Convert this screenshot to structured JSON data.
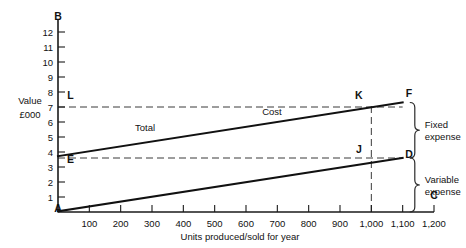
{
  "chart_data": {
    "type": "line",
    "title": "",
    "xlabel": "Units produced/sold for year",
    "ylabel": "Value £000",
    "xlim": [
      0,
      1200
    ],
    "ylim": [
      0,
      12.8
    ],
    "grid": false,
    "legend": "none",
    "x_ticks": [
      {
        "value": 0,
        "label": "A"
      },
      {
        "value": 100,
        "label": "100"
      },
      {
        "value": 200,
        "label": "200"
      },
      {
        "value": 300,
        "label": "300"
      },
      {
        "value": 400,
        "label": "400"
      },
      {
        "value": 500,
        "label": "500"
      },
      {
        "value": 600,
        "label": "600"
      },
      {
        "value": 700,
        "label": "700"
      },
      {
        "value": 800,
        "label": "800"
      },
      {
        "value": 900,
        "label": "900"
      },
      {
        "value": 1000,
        "label": "1,000"
      },
      {
        "value": 1100,
        "label": "1,100"
      },
      {
        "value": 1200,
        "label": "1,200"
      }
    ],
    "y_ticks": [
      {
        "value": 1,
        "label": "1"
      },
      {
        "value": 2,
        "label": "2"
      },
      {
        "value": 3,
        "label": "3"
      },
      {
        "value": 4,
        "label": "4"
      },
      {
        "value": 5,
        "label": "5"
      },
      {
        "value": 6,
        "label": "6"
      },
      {
        "value": 7,
        "label": "7"
      },
      {
        "value": 8,
        "label": "8"
      },
      {
        "value": 9,
        "label": "9"
      },
      {
        "value": 10,
        "label": "10"
      },
      {
        "value": 11,
        "label": "11"
      },
      {
        "value": 12,
        "label": "12"
      }
    ],
    "series": [
      {
        "name": "Total Cost",
        "label_left": "Total",
        "label_right": "Cost",
        "points": [
          [
            0,
            3.72
          ],
          [
            1100,
            7.3
          ]
        ]
      },
      {
        "name": "Variable expense",
        "label_left": "",
        "label_right": "",
        "points": [
          [
            0,
            0.05
          ],
          [
            1100,
            3.6
          ]
        ]
      }
    ],
    "reference_lines": [
      {
        "name": "fixed-cost-level",
        "orientation": "horizontal",
        "value": 7.0,
        "style": "dashed",
        "from_x": 0,
        "to_x": 1100
      },
      {
        "name": "variable-top-level",
        "orientation": "horizontal",
        "value": 3.6,
        "style": "dashed",
        "from_x": 0,
        "to_x": 1100
      },
      {
        "name": "output-1000-marker",
        "orientation": "vertical",
        "value": 1000,
        "style": "dashed",
        "from_y": 0,
        "to_y": 7.2
      }
    ],
    "point_labels": [
      {
        "key": "A",
        "label": "A",
        "x": 0,
        "y": 0
      },
      {
        "key": "B",
        "label": "B",
        "x": 0,
        "y": 12.8
      },
      {
        "key": "C",
        "label": "C",
        "x": 1200,
        "y": 0.85
      },
      {
        "key": "D",
        "label": "D",
        "x": 1120,
        "y": 3.6
      },
      {
        "key": "E",
        "label": "E",
        "x": 40,
        "y": 3.25
      },
      {
        "key": "F",
        "label": "F",
        "x": 1120,
        "y": 7.7
      },
      {
        "key": "J",
        "label": "J",
        "x": 960,
        "y": 3.95
      },
      {
        "key": "K",
        "label": "K",
        "x": 960,
        "y": 7.55
      },
      {
        "key": "L",
        "label": "L",
        "x": 40,
        "y": 7.55
      }
    ],
    "annotations": [
      {
        "key": "fixed-expense",
        "line1": "Fixed",
        "line2": "expense",
        "from_y": 7.3,
        "to_y": 3.6
      },
      {
        "key": "variable-expense",
        "line1": "Variable",
        "line2": "expense",
        "from_y": 3.6,
        "to_y": 0.0
      }
    ]
  },
  "axis": {
    "y_title_line1": "Value",
    "y_title_line2": "£000",
    "x_title": "Units produced/sold for year"
  }
}
